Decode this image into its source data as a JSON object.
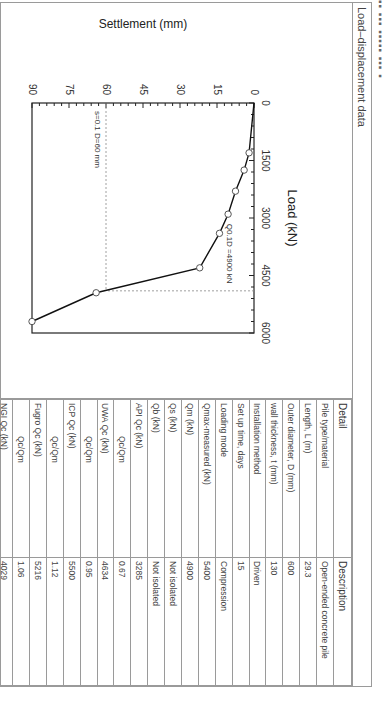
{
  "caption": "Load–displacement data",
  "chart_data": {
    "type": "line",
    "title": "",
    "xlabel": "Load (kN)",
    "ylabel": "Settlement (mm)",
    "xlim": [
      0,
      6000
    ],
    "ylim": [
      0,
      90
    ],
    "y_inverted": true,
    "xticks": [
      "0",
      "1500",
      "3000",
      "4500",
      "6000"
    ],
    "yticks": [
      "0",
      "15",
      "30",
      "45",
      "60",
      "75",
      "90"
    ],
    "grid": false,
    "marker": "open-circle",
    "series": [
      {
        "name": "Measured",
        "x": [
          0,
          1300,
          1750,
          2300,
          2900,
          3400,
          4300,
          4950,
          5700
        ],
        "y": [
          0,
          2,
          4,
          7.5,
          10.5,
          14,
          22,
          64,
          90
        ],
        "markers_at": [
          1300,
          1750,
          2300,
          2900,
          3400,
          4300,
          4950,
          5700
        ]
      }
    ],
    "annotations": [
      {
        "text": "s=0.1 D=60 mm",
        "type": "dashed-horizontal",
        "y": 60
      },
      {
        "text": "Q0.1D =4900 kN",
        "type": "dashed-vertical",
        "x": 4900
      }
    ]
  },
  "table": {
    "headers": [
      "Detail",
      "Description"
    ],
    "rows": [
      {
        "detail": "Pile type/material",
        "value": "Open-ended concrete pile"
      },
      {
        "detail": "Length, L (m)",
        "value": "29.3"
      },
      {
        "detail": "Outer diameter, D (mm)",
        "value": "600"
      },
      {
        "detail": "wall thickness, t (mm)",
        "value": "130"
      },
      {
        "detail": "Installation method",
        "value": "Driven"
      },
      {
        "detail": "Set up time, days",
        "value": "15"
      },
      {
        "detail": "Loading mode",
        "value": "Compression"
      },
      {
        "detail": "Qmax-measured (kN)",
        "value": "5400"
      },
      {
        "detail": "Qm (kN)",
        "value": "4900"
      },
      {
        "detail": "Qs (kN)",
        "value": "Not isolated"
      },
      {
        "detail": "Qb (kN)",
        "value": "Not isolated"
      },
      {
        "detail": "API Qc (kN)",
        "value": "3285"
      },
      {
        "detail": "Qc/Qm",
        "value": "0.67",
        "ratio": true
      },
      {
        "detail": "UWA Qc (kN)",
        "value": "4634"
      },
      {
        "detail": "Qc/Qm",
        "value": "0.95",
        "ratio": true
      },
      {
        "detail": "ICP Qc (kN)",
        "value": "5500"
      },
      {
        "detail": "Qc/Qm",
        "value": "1.12",
        "ratio": true
      },
      {
        "detail": "Fugro Qc (kN)",
        "value": "5216"
      },
      {
        "detail": "Qc/Qm",
        "value": "1.06",
        "ratio": true
      },
      {
        "detail": "NGI Qc (kN)",
        "value": "4029"
      },
      {
        "detail": "Qc/Qm",
        "value": "0.82",
        "ratio": true
      }
    ]
  }
}
